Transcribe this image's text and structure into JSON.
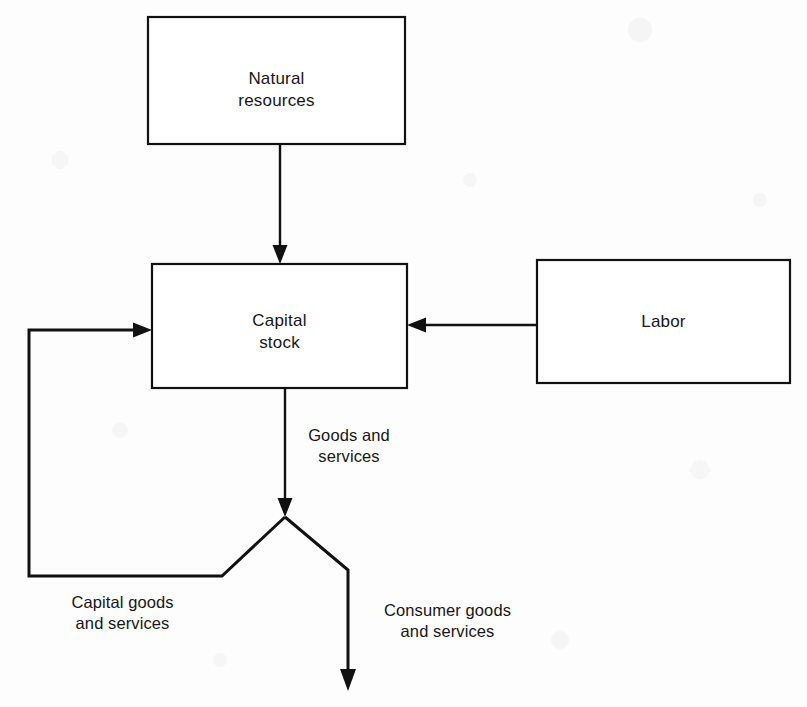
{
  "diagram": {
    "background_color": "#fdfdfd",
    "line_color": "#111111",
    "nodes": [
      {
        "id": "natural-resources",
        "label": "Natural\nresources",
        "x": 148,
        "y": 17,
        "width": 257,
        "height": 127
      },
      {
        "id": "capital-stock",
        "label": "Capital\nstock",
        "x": 152,
        "y": 264,
        "width": 255,
        "height": 124
      },
      {
        "id": "labor",
        "label": "Labor",
        "x": 537,
        "y": 260,
        "width": 253,
        "height": 123
      }
    ],
    "edge_labels": [
      {
        "id": "goods-and-services",
        "label": "Goods and\nservices",
        "x": 289,
        "y": 425,
        "width": 120
      },
      {
        "id": "capital-goods-and-services",
        "label": "Capital goods\nand services",
        "x": 30,
        "y": 592,
        "width": 185
      },
      {
        "id": "consumer-goods-and-services",
        "label": "Consumer goods\nand services",
        "x": 355,
        "y": 600,
        "width": 185
      }
    ],
    "edges": [
      {
        "id": "natural-resources-to-capital-stock",
        "from": "natural-resources",
        "to": "capital-stock",
        "direction": "down"
      },
      {
        "id": "labor-to-capital-stock",
        "from": "labor",
        "to": "capital-stock",
        "direction": "left"
      },
      {
        "id": "capital-stock-to-split",
        "from": "capital-stock",
        "to": "split-point",
        "direction": "down"
      },
      {
        "id": "split-to-capital-goods-feedback",
        "from": "split-point",
        "to": "capital-stock",
        "direction": "loop-left"
      },
      {
        "id": "split-to-consumer-goods",
        "from": "split-point",
        "to": "consumer-output",
        "direction": "down"
      }
    ]
  }
}
